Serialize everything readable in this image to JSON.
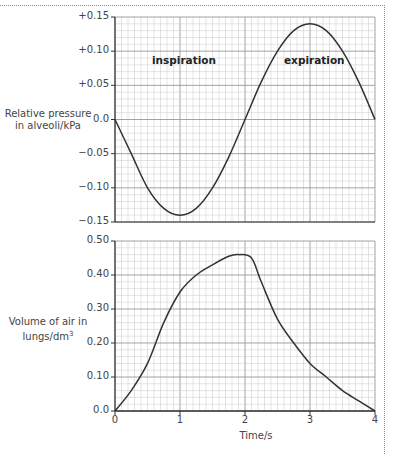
{
  "chart_data": [
    {
      "type": "line",
      "title": "",
      "xlabel": "",
      "ylabel": "Relative pressure in alveoli/kPa",
      "xlim": [
        0,
        4
      ],
      "ylim": [
        -0.15,
        0.15
      ],
      "yticks": [
        "+0.15",
        "+0.10",
        "+0.05",
        "0.0",
        "−0.05",
        "−0.10",
        "−0.15"
      ],
      "grid": true,
      "annotations": [
        "inspiration",
        "expiration"
      ],
      "series": [
        {
          "name": "Relative pressure",
          "x": [
            0,
            0.25,
            0.5,
            0.75,
            1.0,
            1.25,
            1.5,
            1.75,
            2.0,
            2.25,
            2.5,
            2.75,
            3.0,
            3.25,
            3.5,
            3.75,
            4.0
          ],
          "values": [
            0.0,
            -0.05,
            -0.1,
            -0.13,
            -0.14,
            -0.13,
            -0.1,
            -0.055,
            0.0,
            0.055,
            0.1,
            0.13,
            0.14,
            0.13,
            0.1,
            0.055,
            0.0
          ]
        }
      ]
    },
    {
      "type": "line",
      "title": "",
      "xlabel": "Time/s",
      "ylabel": "Volume of air in lungs/dm³",
      "xlim": [
        0,
        4
      ],
      "ylim": [
        0,
        0.5
      ],
      "xticks": [
        "0",
        "1",
        "2",
        "3",
        "4"
      ],
      "yticks": [
        "0.50",
        "0.40",
        "0.30",
        "0.20",
        "0.10",
        "0.0"
      ],
      "grid": true,
      "series": [
        {
          "name": "Volume",
          "x": [
            0,
            0.25,
            0.5,
            0.75,
            1.0,
            1.25,
            1.5,
            1.75,
            1.9,
            2.1,
            2.25,
            2.5,
            2.75,
            3.0,
            3.25,
            3.5,
            3.75,
            4.0
          ],
          "values": [
            0.0,
            0.06,
            0.14,
            0.26,
            0.35,
            0.4,
            0.43,
            0.455,
            0.46,
            0.45,
            0.38,
            0.27,
            0.2,
            0.14,
            0.1,
            0.06,
            0.03,
            0.0
          ]
        }
      ]
    }
  ],
  "labels": {
    "top_ylabel_line1": "Relative pressure",
    "top_ylabel_line2": "in alveoli/kPa",
    "bottom_ylabel_line1": "Volume of air in",
    "bottom_ylabel_line2": "lungs/dm",
    "bottom_ylabel_sup": "3",
    "inspiration": "inspiration",
    "expiration": "expiration",
    "xlabel": "Time/s",
    "top_yticks": [
      "+0.15",
      "+0.10",
      "+0.05",
      "0.0",
      "−0.05",
      "−0.10",
      "−0.15"
    ],
    "bottom_yticks": [
      "0.50",
      "0.40",
      "0.30",
      "0.20",
      "0.10",
      "0.0"
    ],
    "xticks": [
      "0",
      "1",
      "2",
      "3",
      "4"
    ]
  }
}
